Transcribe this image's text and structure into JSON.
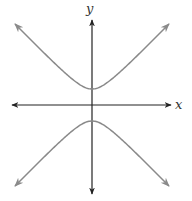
{
  "chart_data": {
    "type": "line",
    "title": "",
    "xlabel": "x",
    "ylabel": "y",
    "grid": false,
    "legend": null,
    "ticks": {
      "x": [],
      "y": []
    },
    "axes": {
      "x_arrows": "both",
      "y_arrows": "both"
    },
    "equation_form": "y^2/a^2 - x^2/b^2 = 1",
    "a_to_b_ratio": 1,
    "series": [
      {
        "name": "upper-branch",
        "vertex": [
          0,
          1
        ],
        "opens": "up"
      },
      {
        "name": "lower-branch",
        "vertex": [
          0,
          -1
        ],
        "opens": "down"
      }
    ]
  },
  "style": {
    "axis_color": "#222222",
    "curve_color": "#8a8a8a"
  },
  "layout": {
    "origin_px": [
      92,
      105
    ],
    "a_px": 16,
    "b_px": 15.5,
    "x_axis_px": [
      12,
      171
    ],
    "y_axis_px": [
      20,
      194
    ],
    "x_extent_px": 77
  }
}
